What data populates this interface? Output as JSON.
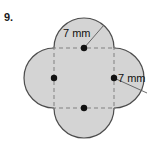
{
  "problem": {
    "number": "9."
  },
  "figure": {
    "name": "quatrefoil-four-circles-on-square",
    "fill_color": "#d4d4d4",
    "stroke_color": "#4d4d4d",
    "dash_color": "#808080",
    "dot_color": "#111111",
    "square": {
      "x": 54,
      "y": 48,
      "size": 60
    },
    "circle_radius": 30,
    "circles": [
      {
        "name": "top-circle",
        "cx": 84,
        "cy": 48
      },
      {
        "name": "right-circle",
        "cx": 114,
        "cy": 78
      },
      {
        "name": "bottom-circle",
        "cx": 84,
        "cy": 108
      },
      {
        "name": "left-circle",
        "cx": 54,
        "cy": 78
      }
    ],
    "center_dots": [
      {
        "name": "top-center-dot",
        "cx": 84,
        "cy": 48
      },
      {
        "name": "right-center-dot",
        "cx": 114,
        "cy": 78
      },
      {
        "name": "bottom-center-dot",
        "cx": 84,
        "cy": 108
      },
      {
        "name": "left-center-dot",
        "cx": 54,
        "cy": 78
      }
    ],
    "radius_labels": [
      {
        "name": "top-radius-label",
        "text": "7 mm",
        "text_x": 63,
        "text_y": 37,
        "line_x1": 84,
        "line_y1": 48,
        "line_x2": 104,
        "line_y2": 25
      },
      {
        "name": "right-radius-label",
        "text": "7 mm",
        "text_x": 118,
        "text_y": 82,
        "line_x1": 114,
        "line_y1": 78,
        "line_x2": 147,
        "line_y2": 93
      }
    ]
  }
}
